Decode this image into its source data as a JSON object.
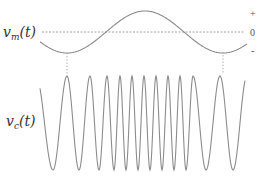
{
  "figure": {
    "colors": {
      "wave": "#8c8c8c",
      "dashed_zero": "#8c8c8c",
      "dotted_guides": "#9a9a9a",
      "text": "#333333"
    }
  },
  "message": {
    "label_main": "v",
    "label_sub": "m",
    "label_arg": "(t)",
    "zero_axis_y": 32,
    "amplitude_px": 21,
    "x_start": 40,
    "x_end": 247,
    "period_px": 156,
    "phase_trough_x": 67,
    "levels": {
      "plus": "+",
      "zero": "0",
      "minus": "-"
    }
  },
  "carrier": {
    "label_main": "v",
    "label_sub": "c",
    "label_arg": "(t)",
    "top_y": 76,
    "bottom_y": 170,
    "x_start": 40,
    "x_end": 245,
    "peaks_x": [
      67,
      90,
      107,
      120,
      132,
      144,
      156,
      168,
      180,
      193,
      220
    ],
    "troughs_x": [
      53,
      79,
      99,
      114,
      126,
      138,
      150,
      162,
      174,
      186,
      206,
      233
    ]
  },
  "guides": [
    {
      "x": 67,
      "y1": 53,
      "y2": 74
    },
    {
      "x": 223,
      "y1": 52,
      "y2": 74
    }
  ]
}
